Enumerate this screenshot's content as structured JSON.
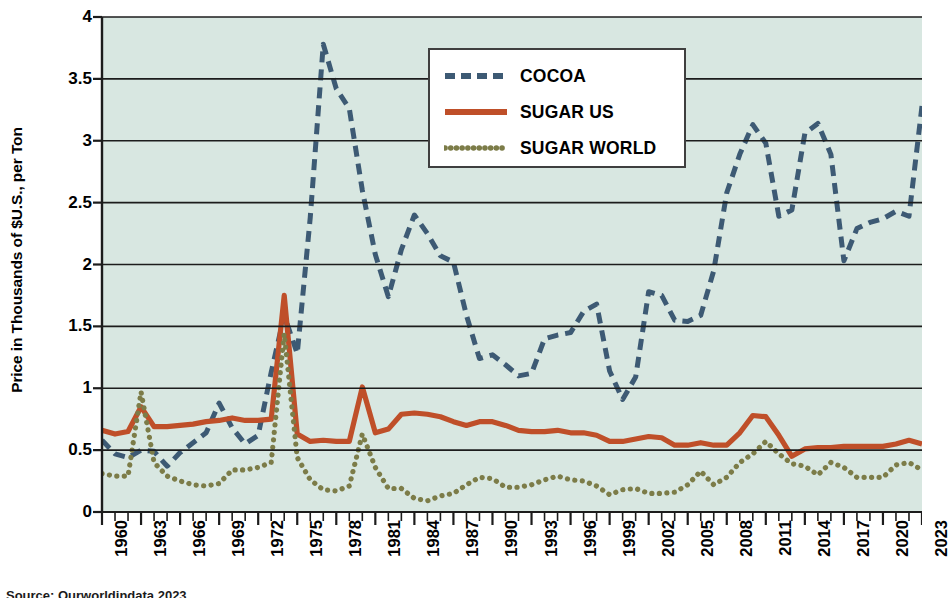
{
  "chart_data": {
    "type": "line",
    "title": "",
    "xlabel": "",
    "ylabel": "Price in Thousands of $U.S., per Ton",
    "ylim": [
      0,
      4
    ],
    "xlim": [
      1960,
      2023
    ],
    "grid": true,
    "legend_position": "top-center",
    "y_ticks": [
      "0",
      "0.5",
      "1",
      "1.5",
      "2",
      "2.5",
      "3",
      "3.5",
      "4"
    ],
    "y_tick_values": [
      0,
      0.5,
      1,
      1.5,
      2,
      2.5,
      3,
      3.5,
      4
    ],
    "x_tick_labels": [
      "1960",
      "1963",
      "1966",
      "1969",
      "1972",
      "1975",
      "1978",
      "1981",
      "1984",
      "1987",
      "1990",
      "1993",
      "1996",
      "1999",
      "2002",
      "2005",
      "2008",
      "2011",
      "2014",
      "2017",
      "2020",
      "2023"
    ],
    "x": [
      1960,
      1961,
      1962,
      1963,
      1964,
      1965,
      1966,
      1967,
      1968,
      1969,
      1970,
      1971,
      1972,
      1973,
      1974,
      1975,
      1976,
      1977,
      1978,
      1979,
      1980,
      1981,
      1982,
      1983,
      1984,
      1985,
      1986,
      1987,
      1988,
      1989,
      1990,
      1991,
      1992,
      1993,
      1994,
      1995,
      1996,
      1997,
      1998,
      1999,
      2000,
      2001,
      2002,
      2003,
      2004,
      2005,
      2006,
      2007,
      2008,
      2009,
      2010,
      2011,
      2012,
      2013,
      2014,
      2015,
      2016,
      2017,
      2018,
      2019,
      2020,
      2021,
      2022,
      2023
    ],
    "series": [
      {
        "name": "COCOA",
        "color": "#3d5a74",
        "style": "dashed",
        "values": [
          0.58,
          0.47,
          0.44,
          0.5,
          0.49,
          0.37,
          0.48,
          0.56,
          0.64,
          0.88,
          0.68,
          0.55,
          0.62,
          1.13,
          1.59,
          1.28,
          2.38,
          3.78,
          3.42,
          3.26,
          2.6,
          2.08,
          1.74,
          2.12,
          2.4,
          2.25,
          2.07,
          2.02,
          1.59,
          1.24,
          1.27,
          1.19,
          1.1,
          1.12,
          1.4,
          1.43,
          1.45,
          1.62,
          1.68,
          1.14,
          0.91,
          1.09,
          1.78,
          1.75,
          1.55,
          1.54,
          1.59,
          1.95,
          2.58,
          2.89,
          3.13,
          2.98,
          2.39,
          2.44,
          3.06,
          3.14,
          2.89,
          2.03,
          2.29,
          2.34,
          2.37,
          2.43,
          2.39,
          3.28
        ]
      },
      {
        "name": "SUGAR US",
        "color": "#bf4f29",
        "style": "solid",
        "values": [
          0.66,
          0.63,
          0.65,
          0.85,
          0.69,
          0.69,
          0.7,
          0.71,
          0.73,
          0.74,
          0.76,
          0.74,
          0.74,
          0.75,
          1.75,
          0.63,
          0.57,
          0.58,
          0.57,
          0.57,
          1.01,
          0.64,
          0.67,
          0.79,
          0.8,
          0.79,
          0.77,
          0.73,
          0.7,
          0.73,
          0.73,
          0.7,
          0.66,
          0.65,
          0.65,
          0.66,
          0.64,
          0.64,
          0.62,
          0.57,
          0.57,
          0.59,
          0.61,
          0.6,
          0.54,
          0.54,
          0.56,
          0.54,
          0.54,
          0.64,
          0.78,
          0.77,
          0.62,
          0.45,
          0.51,
          0.52,
          0.52,
          0.53,
          0.53,
          0.53,
          0.53,
          0.55,
          0.58,
          0.55
        ]
      },
      {
        "name": "SUGAR WORLD",
        "color": "#7c7c48",
        "style": "dotted",
        "values": [
          0.31,
          0.29,
          0.29,
          0.97,
          0.4,
          0.29,
          0.25,
          0.22,
          0.21,
          0.23,
          0.34,
          0.34,
          0.36,
          0.4,
          1.44,
          0.44,
          0.26,
          0.18,
          0.17,
          0.21,
          0.63,
          0.36,
          0.19,
          0.19,
          0.11,
          0.09,
          0.13,
          0.15,
          0.22,
          0.28,
          0.27,
          0.2,
          0.2,
          0.22,
          0.26,
          0.29,
          0.26,
          0.25,
          0.21,
          0.14,
          0.18,
          0.19,
          0.15,
          0.15,
          0.16,
          0.22,
          0.33,
          0.22,
          0.28,
          0.4,
          0.47,
          0.57,
          0.47,
          0.39,
          0.37,
          0.3,
          0.4,
          0.36,
          0.28,
          0.28,
          0.28,
          0.38,
          0.4,
          0.34
        ]
      }
    ]
  },
  "legend": {
    "items": [
      {
        "label": "COCOA"
      },
      {
        "label": "SUGAR US"
      },
      {
        "label": "SUGAR WORLD"
      }
    ]
  },
  "axes": {
    "y_title": "Price in Thousands of $U.S., per Ton"
  },
  "colors": {
    "plot_background": "#d8e7e1",
    "gridline": "#1c1c1c",
    "axis": "#1c1c1c",
    "cocoa": "#3d5a74",
    "sugar_us": "#bf4f29",
    "sugar_world": "#7c7c48",
    "legend_background": "#ffffff",
    "legend_border": "#3f3f3f"
  },
  "source_note": "Source: Ourworldindata 2023"
}
